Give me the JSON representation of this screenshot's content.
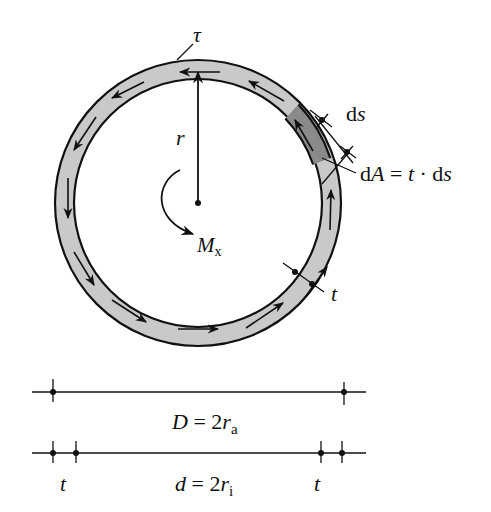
{
  "figure": {
    "type": "thin-walled circular tube cross-section under torsion",
    "colors": {
      "ring_fill": "#c9c9c9",
      "element_fill": "#8a8a8a",
      "stroke": "#111111",
      "background": "#ffffff"
    },
    "labels": {
      "tau": "τ",
      "r": "r",
      "moment_main": "M",
      "moment_sub": "x",
      "ds_d": "d",
      "ds_s": "s",
      "dA_d": "d",
      "dA_A": "A",
      "dA_eq": " = ",
      "dA_t": "t",
      "dA_dot": " · d",
      "dA_s": "s",
      "t_ring": "t"
    },
    "dimensions": {
      "outer": {
        "lhs": "D",
        "eq": " = 2",
        "r": "r",
        "sub": "a"
      },
      "inner": {
        "lhs": "d",
        "eq": " = 2",
        "r": "r",
        "sub": "i"
      },
      "t_left": "t",
      "t_right": "t"
    }
  }
}
